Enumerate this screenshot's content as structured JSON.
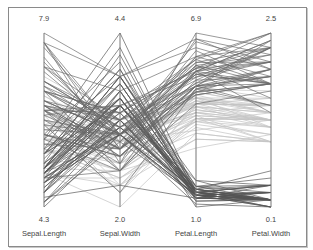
{
  "chart_data": {
    "type": "parallel_coordinates",
    "title": "",
    "axes": [
      {
        "name": "Sepal.Length",
        "min": 4.3,
        "max": 7.9,
        "min_label": "4.3",
        "max_label": "7.9"
      },
      {
        "name": "Sepal.Width",
        "min": 2.0,
        "max": 4.4,
        "min_label": "2.0",
        "max_label": "4.4"
      },
      {
        "name": "Petal.Length",
        "min": 1.0,
        "max": 6.9,
        "min_label": "1.0",
        "max_label": "6.9"
      },
      {
        "name": "Petal.Width",
        "min": 0.1,
        "max": 2.5,
        "min_label": "0.1",
        "max_label": "2.5"
      }
    ],
    "groups": [
      {
        "name": "setosa",
        "color": "#555555"
      },
      {
        "name": "versicolor",
        "color": "#c4c4c4"
      },
      {
        "name": "virginica",
        "color": "#6a6a6a"
      }
    ],
    "grid": false,
    "legend": "none",
    "series": {
      "setosa": [
        [
          5.1,
          3.5,
          1.4,
          0.2
        ],
        [
          4.9,
          3.0,
          1.4,
          0.2
        ],
        [
          4.7,
          3.2,
          1.3,
          0.2
        ],
        [
          4.6,
          3.1,
          1.5,
          0.2
        ],
        [
          5.0,
          3.6,
          1.4,
          0.2
        ],
        [
          5.4,
          3.9,
          1.7,
          0.4
        ],
        [
          4.6,
          3.4,
          1.4,
          0.3
        ],
        [
          5.0,
          3.4,
          1.5,
          0.2
        ],
        [
          4.4,
          2.9,
          1.4,
          0.2
        ],
        [
          4.9,
          3.1,
          1.5,
          0.1
        ],
        [
          5.4,
          3.7,
          1.5,
          0.2
        ],
        [
          4.8,
          3.4,
          1.6,
          0.2
        ],
        [
          4.8,
          3.0,
          1.4,
          0.1
        ],
        [
          4.3,
          3.0,
          1.1,
          0.1
        ],
        [
          5.8,
          4.0,
          1.2,
          0.2
        ],
        [
          5.7,
          4.4,
          1.5,
          0.4
        ],
        [
          5.4,
          3.9,
          1.3,
          0.4
        ],
        [
          5.1,
          3.5,
          1.4,
          0.3
        ],
        [
          5.7,
          3.8,
          1.7,
          0.3
        ],
        [
          5.1,
          3.8,
          1.5,
          0.3
        ],
        [
          5.4,
          3.4,
          1.7,
          0.2
        ],
        [
          5.1,
          3.7,
          1.5,
          0.4
        ],
        [
          4.6,
          3.6,
          1.0,
          0.2
        ],
        [
          5.1,
          3.3,
          1.7,
          0.5
        ],
        [
          4.8,
          3.4,
          1.9,
          0.2
        ],
        [
          5.0,
          3.0,
          1.6,
          0.2
        ],
        [
          5.0,
          3.4,
          1.6,
          0.4
        ],
        [
          5.2,
          3.5,
          1.5,
          0.2
        ],
        [
          5.2,
          3.4,
          1.4,
          0.2
        ],
        [
          4.7,
          3.2,
          1.6,
          0.2
        ],
        [
          4.8,
          3.1,
          1.6,
          0.2
        ],
        [
          5.4,
          3.4,
          1.5,
          0.4
        ],
        [
          5.2,
          4.1,
          1.5,
          0.1
        ],
        [
          5.5,
          4.2,
          1.4,
          0.2
        ],
        [
          4.9,
          3.1,
          1.5,
          0.2
        ],
        [
          5.0,
          3.2,
          1.2,
          0.2
        ],
        [
          5.5,
          3.5,
          1.3,
          0.2
        ],
        [
          4.9,
          3.6,
          1.4,
          0.1
        ],
        [
          4.4,
          3.0,
          1.3,
          0.2
        ],
        [
          5.1,
          3.4,
          1.5,
          0.2
        ],
        [
          5.0,
          3.5,
          1.3,
          0.3
        ],
        [
          4.5,
          2.3,
          1.3,
          0.3
        ],
        [
          4.4,
          3.2,
          1.3,
          0.2
        ],
        [
          5.0,
          3.5,
          1.6,
          0.6
        ],
        [
          5.1,
          3.8,
          1.9,
          0.4
        ],
        [
          4.8,
          3.0,
          1.4,
          0.3
        ],
        [
          5.1,
          3.8,
          1.6,
          0.2
        ],
        [
          4.6,
          3.2,
          1.4,
          0.2
        ],
        [
          5.3,
          3.7,
          1.5,
          0.2
        ],
        [
          5.0,
          3.3,
          1.4,
          0.2
        ]
      ],
      "versicolor": [
        [
          7.0,
          3.2,
          4.7,
          1.4
        ],
        [
          6.4,
          3.2,
          4.5,
          1.5
        ],
        [
          6.9,
          3.1,
          4.9,
          1.5
        ],
        [
          5.5,
          2.3,
          4.0,
          1.3
        ],
        [
          6.5,
          2.8,
          4.6,
          1.5
        ],
        [
          5.7,
          2.8,
          4.5,
          1.3
        ],
        [
          6.3,
          3.3,
          4.7,
          1.6
        ],
        [
          4.9,
          2.4,
          3.3,
          1.0
        ],
        [
          6.6,
          2.9,
          4.6,
          1.3
        ],
        [
          5.2,
          2.7,
          3.9,
          1.4
        ],
        [
          5.0,
          2.0,
          3.5,
          1.0
        ],
        [
          5.9,
          3.0,
          4.2,
          1.5
        ],
        [
          6.0,
          2.2,
          4.0,
          1.0
        ],
        [
          6.1,
          2.9,
          4.7,
          1.4
        ],
        [
          5.6,
          2.9,
          3.6,
          1.3
        ],
        [
          6.7,
          3.1,
          4.4,
          1.4
        ],
        [
          5.6,
          3.0,
          4.5,
          1.5
        ],
        [
          5.8,
          2.7,
          4.1,
          1.0
        ],
        [
          6.2,
          2.2,
          4.5,
          1.5
        ],
        [
          5.6,
          2.5,
          3.9,
          1.1
        ],
        [
          5.9,
          3.2,
          4.8,
          1.8
        ],
        [
          6.1,
          2.8,
          4.0,
          1.3
        ],
        [
          6.3,
          2.5,
          4.9,
          1.5
        ],
        [
          6.1,
          2.8,
          4.7,
          1.2
        ],
        [
          6.4,
          2.9,
          4.3,
          1.3
        ],
        [
          6.6,
          3.0,
          4.4,
          1.4
        ],
        [
          6.8,
          2.8,
          4.8,
          1.4
        ],
        [
          6.7,
          3.0,
          5.0,
          1.7
        ],
        [
          6.0,
          2.9,
          4.5,
          1.5
        ],
        [
          5.7,
          2.6,
          3.5,
          1.0
        ],
        [
          5.5,
          2.4,
          3.8,
          1.1
        ],
        [
          5.5,
          2.4,
          3.7,
          1.0
        ],
        [
          5.8,
          2.7,
          3.9,
          1.2
        ],
        [
          6.0,
          2.7,
          5.1,
          1.6
        ],
        [
          5.4,
          3.0,
          4.5,
          1.5
        ],
        [
          6.0,
          3.4,
          4.5,
          1.6
        ],
        [
          6.7,
          3.1,
          4.7,
          1.5
        ],
        [
          6.3,
          2.3,
          4.4,
          1.3
        ],
        [
          5.6,
          3.0,
          4.1,
          1.3
        ],
        [
          5.5,
          2.5,
          4.0,
          1.3
        ],
        [
          5.5,
          2.6,
          4.4,
          1.2
        ],
        [
          6.1,
          3.0,
          4.6,
          1.4
        ],
        [
          5.8,
          2.6,
          4.0,
          1.2
        ],
        [
          5.0,
          2.3,
          3.3,
          1.0
        ],
        [
          5.6,
          2.7,
          4.2,
          1.3
        ],
        [
          5.7,
          3.0,
          4.2,
          1.2
        ],
        [
          5.7,
          2.9,
          4.2,
          1.3
        ],
        [
          6.2,
          2.9,
          4.3,
          1.3
        ],
        [
          5.1,
          2.5,
          3.0,
          1.1
        ],
        [
          5.7,
          2.8,
          4.1,
          1.3
        ]
      ],
      "virginica": [
        [
          6.3,
          3.3,
          6.0,
          2.5
        ],
        [
          5.8,
          2.7,
          5.1,
          1.9
        ],
        [
          7.1,
          3.0,
          5.9,
          2.1
        ],
        [
          6.3,
          2.9,
          5.6,
          1.8
        ],
        [
          6.5,
          3.0,
          5.8,
          2.2
        ],
        [
          7.6,
          3.0,
          6.6,
          2.1
        ],
        [
          4.9,
          2.5,
          4.5,
          1.7
        ],
        [
          7.3,
          2.9,
          6.3,
          1.8
        ],
        [
          6.7,
          2.5,
          5.8,
          1.8
        ],
        [
          7.2,
          3.6,
          6.1,
          2.5
        ],
        [
          6.5,
          3.2,
          5.1,
          2.0
        ],
        [
          6.4,
          2.7,
          5.3,
          1.9
        ],
        [
          6.8,
          3.0,
          5.5,
          2.1
        ],
        [
          5.7,
          2.5,
          5.0,
          2.0
        ],
        [
          5.8,
          2.8,
          5.1,
          2.4
        ],
        [
          6.4,
          3.2,
          5.3,
          2.3
        ],
        [
          6.5,
          3.0,
          5.5,
          1.8
        ],
        [
          7.7,
          3.8,
          6.7,
          2.2
        ],
        [
          7.7,
          2.6,
          6.9,
          2.3
        ],
        [
          6.0,
          2.2,
          5.0,
          1.5
        ],
        [
          6.9,
          3.2,
          5.7,
          2.3
        ],
        [
          5.6,
          2.8,
          4.9,
          2.0
        ],
        [
          7.7,
          2.8,
          6.7,
          2.0
        ],
        [
          6.3,
          2.7,
          4.9,
          1.8
        ],
        [
          6.7,
          3.3,
          5.7,
          2.1
        ],
        [
          7.2,
          3.2,
          6.0,
          1.8
        ],
        [
          6.2,
          2.8,
          4.8,
          1.8
        ],
        [
          6.1,
          3.0,
          4.9,
          1.8
        ],
        [
          6.4,
          2.8,
          5.6,
          2.1
        ],
        [
          7.2,
          3.0,
          5.8,
          1.6
        ],
        [
          7.4,
          2.8,
          6.1,
          1.9
        ],
        [
          7.9,
          3.8,
          6.4,
          2.0
        ],
        [
          6.4,
          2.8,
          5.6,
          2.2
        ],
        [
          6.3,
          2.8,
          5.1,
          1.5
        ],
        [
          6.1,
          2.6,
          5.6,
          1.4
        ],
        [
          7.7,
          3.0,
          6.1,
          2.3
        ],
        [
          6.3,
          3.4,
          5.6,
          2.4
        ],
        [
          6.4,
          3.1,
          5.5,
          1.8
        ],
        [
          6.0,
          3.0,
          4.8,
          1.8
        ],
        [
          6.9,
          3.1,
          5.4,
          2.1
        ],
        [
          6.7,
          3.1,
          5.6,
          2.4
        ],
        [
          6.9,
          3.1,
          5.1,
          2.3
        ],
        [
          5.8,
          2.7,
          5.1,
          1.9
        ],
        [
          6.8,
          3.2,
          5.9,
          2.3
        ],
        [
          6.7,
          3.3,
          5.7,
          2.5
        ],
        [
          6.7,
          3.0,
          5.2,
          2.3
        ],
        [
          6.3,
          2.5,
          5.0,
          1.9
        ],
        [
          6.5,
          3.0,
          5.2,
          2.0
        ],
        [
          6.2,
          3.4,
          5.4,
          2.3
        ],
        [
          5.9,
          3.0,
          5.1,
          1.8
        ]
      ]
    }
  },
  "layout_hint": {
    "axis_x": [
      44,
      120,
      196,
      271
    ],
    "axis_top": 33,
    "axis_bottom": 207
  }
}
